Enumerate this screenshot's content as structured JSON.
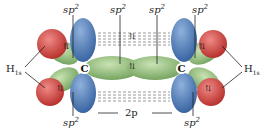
{
  "diagram": {
    "labels": {
      "sp2_top_left": "sp",
      "sp2_top_midleft": "sp",
      "sp2_top_midright": "sp",
      "sp2_top_right": "sp",
      "sp2_bottom_left": "sp",
      "sp2_bottom_right": "sp",
      "sup": "2",
      "p2": "2p",
      "carbon_left": "C",
      "carbon_right": "C",
      "h_left": "H",
      "h_right": "H",
      "h_sub": "1s",
      "spin": "⇅"
    },
    "colors": {
      "hydrogen_1s": "#d9534f",
      "sp2_lobe": "#8fc07a",
      "p_lobe": "#4f7fbf",
      "background": "#ffffff"
    }
  }
}
